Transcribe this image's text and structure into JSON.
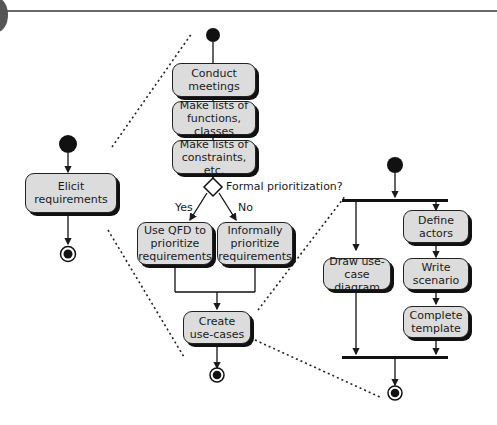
{
  "diagram": {
    "type": "UML activity diagram (hierarchical decomposition)",
    "top_level": {
      "activities": [
        "Elicit requirements"
      ]
    },
    "elicit_requirements_detail": {
      "activities": [
        "Conduct meetings",
        "Make lists of functions, classes",
        "Make lists of constraints, etc.",
        "Use QFD to prioritize requirements",
        "Informally prioritize requirements",
        "Create use-cases"
      ],
      "decision": {
        "label": "Formal prioritization?",
        "yes_label": "Yes",
        "no_label": "No"
      }
    },
    "create_use_cases_detail": {
      "activities": [
        "Draw use-case diagram",
        "Define actors",
        "Write scenario",
        "Complete template"
      ],
      "has_fork": true,
      "has_join": true
    }
  },
  "nodes": {
    "elicit": "Elicit requirements",
    "conduct": [
      "Conduct",
      "meetings"
    ],
    "functions": [
      "Make lists of",
      "functions, classes"
    ],
    "constraints": [
      "Make lists of",
      "constraints, etc."
    ],
    "qfd": [
      "Use QFD to",
      "prioritize",
      "requirements"
    ],
    "informal": [
      "Informally",
      "prioritize",
      "requirements"
    ],
    "usecases": [
      "Create",
      "use-cases"
    ],
    "draw": [
      "Draw use-case",
      "diagram"
    ],
    "actors": [
      "Define",
      "actors"
    ],
    "scenario": [
      "Write",
      "scenario"
    ],
    "template": [
      "Complete",
      "template"
    ]
  },
  "labels": {
    "decision": "Formal prioritization?",
    "yes": "Yes",
    "no": "No"
  },
  "colors": {
    "node_fill": "#dcdcdc",
    "stroke": "#1a1a1a",
    "background": "#ffffff"
  }
}
